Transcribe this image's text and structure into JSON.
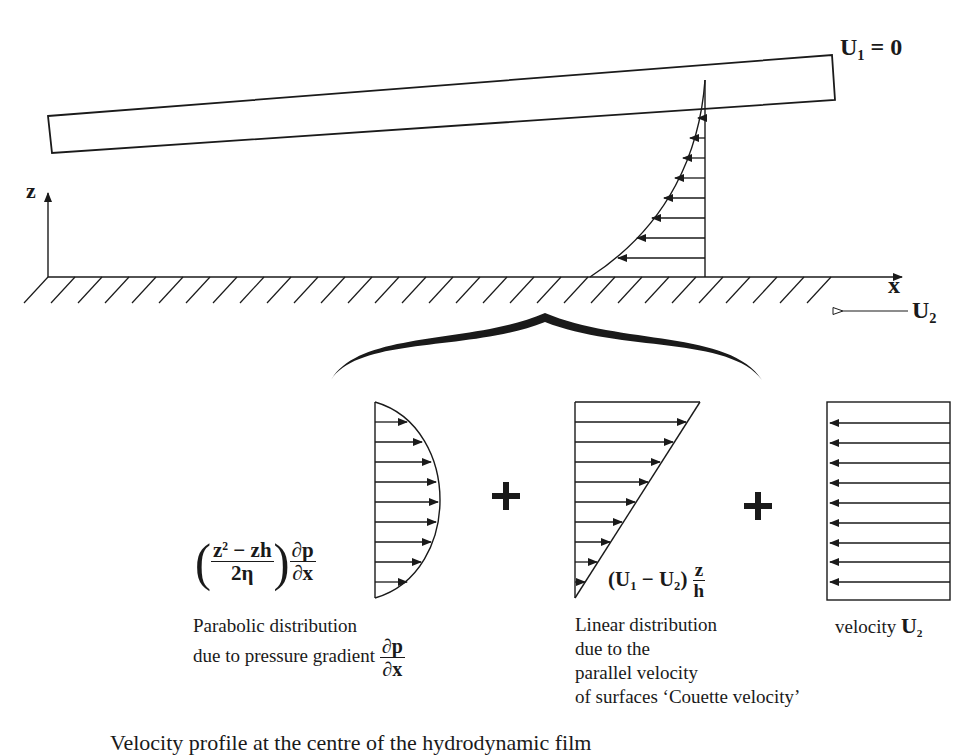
{
  "diagram": {
    "top_surface": {
      "label_var": "U",
      "label_sub": "1",
      "label_rest": " = 0"
    },
    "axes": {
      "z_label": "z",
      "x_label": "x"
    },
    "bottom_surface": {
      "velocity_var": "U",
      "velocity_sub": "2"
    },
    "components": [
      {
        "name": "parabolic",
        "formula": {
          "num_a": "z",
          "num_sup": "2",
          "num_b": " − zh",
          "den": "2η",
          "grad_num": "∂p",
          "grad_den": "∂x"
        },
        "caption_line1": "Parabolic distribution",
        "caption_line2": "due to pressure gradient",
        "caption_grad_num": "∂p",
        "caption_grad_den": "∂x",
        "arrow_count": 9,
        "arrow_direction": "right"
      },
      {
        "name": "linear",
        "formula": {
          "open": "(U",
          "sub1": "1",
          "mid": " − U",
          "sub2": "2",
          "close": ")",
          "frac_num": "z",
          "frac_den": "h"
        },
        "caption_lines": [
          "Linear distribution",
          "due to the",
          "parallel velocity",
          "of surfaces ‘Couette velocity’"
        ],
        "arrow_count": 9,
        "arrow_direction": "right"
      },
      {
        "name": "uniform",
        "caption_prefix": "velocity ",
        "caption_var": "U",
        "caption_sub": "2",
        "arrow_count": 9,
        "arrow_direction": "left"
      }
    ],
    "operators": [
      "+",
      "+"
    ],
    "figure_caption": "Velocity profile at the centre of the hydrodynamic film"
  }
}
